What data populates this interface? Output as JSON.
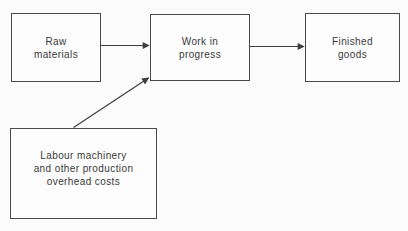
{
  "diagram": {
    "type": "flowchart",
    "nodes": {
      "raw_materials": {
        "label": "Raw\nmaterials"
      },
      "work_in_progress": {
        "label": "Work in\nprogress"
      },
      "finished_goods": {
        "label": "Finished\ngoods"
      },
      "overhead_costs": {
        "label": "Labour machinery\nand other production\noverhead costs"
      }
    },
    "edges": [
      {
        "from": "raw_materials",
        "to": "work_in_progress",
        "style": "horizontal-arrow"
      },
      {
        "from": "work_in_progress",
        "to": "finished_goods",
        "style": "horizontal-arrow"
      },
      {
        "from": "overhead_costs",
        "to": "work_in_progress",
        "style": "diagonal-arrow"
      }
    ],
    "colors": {
      "background": "#fbfbfb",
      "box_border": "#4a4a4a",
      "box_fill": "#fdfdfd",
      "line": "#3f3f3f",
      "text": "#3a3a3a"
    }
  }
}
